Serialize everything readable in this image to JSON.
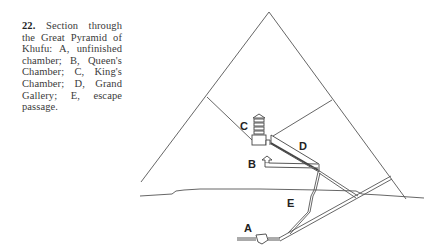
{
  "caption": {
    "number": "22.",
    "text": "Section through the Great Pyramid of Khufu: A, unfinished chamber; B, Queen's Chamber; C, King's Chamber; D, Grand Gallery; E, escape passage."
  },
  "labels": {
    "A": "A",
    "B": "B",
    "C": "C",
    "D": "D",
    "E": "E"
  },
  "colors": {
    "line": "#555555",
    "text": "#222222"
  }
}
